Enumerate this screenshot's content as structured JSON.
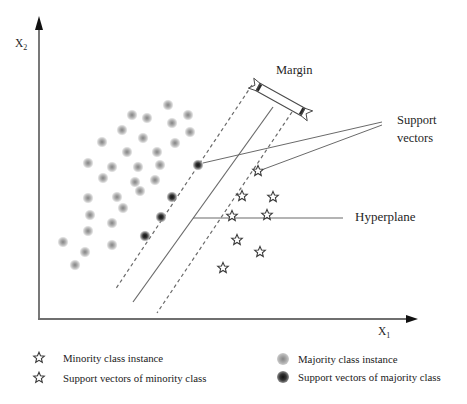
{
  "figure": {
    "axes": {
      "y_label_base": "X",
      "y_label_sub": "2",
      "x_label_base": "X",
      "x_label_sub": "1"
    },
    "labels": {
      "margin": "Margin",
      "support_vectors_line1": "Support",
      "support_vectors_line2": "vectors",
      "hyperplane": "Hyperplane"
    }
  },
  "legend": {
    "items": [
      {
        "icon": "open-star",
        "label": "Minority class instance"
      },
      {
        "icon": "open-star",
        "label": "Support vectors of minority class"
      },
      {
        "icon": "fuzzy-gray-dot",
        "label": "Majority class instance"
      },
      {
        "icon": "dark-dot",
        "label": "Support vectors of majority class"
      }
    ]
  },
  "chart_data": {
    "type": "scatter",
    "xlabel": "X1",
    "ylabel": "X2",
    "coordinate_space": "pixels, 467x404, y increases downward",
    "series": [
      {
        "name": "Majority class instance",
        "marker": "fuzzy-gray-dot",
        "points": [
          [
            168,
            105
          ],
          [
            188,
            115
          ],
          [
            132,
            115
          ],
          [
            147,
            118
          ],
          [
            172,
            123
          ],
          [
            122,
            130
          ],
          [
            190,
            132
          ],
          [
            143,
            138
          ],
          [
            102,
            142
          ],
          [
            175,
            143
          ],
          [
            127,
            152
          ],
          [
            157,
            152
          ],
          [
            88,
            163
          ],
          [
            160,
            165
          ],
          [
            112,
            167
          ],
          [
            138,
            167
          ],
          [
            103,
            178
          ],
          [
            155,
            180
          ],
          [
            135,
            182
          ],
          [
            140,
            191
          ],
          [
            117,
            197
          ],
          [
            88,
            198
          ],
          [
            123,
            208
          ],
          [
            90,
            215
          ],
          [
            112,
            223
          ],
          [
            88,
            231
          ],
          [
            63,
            242
          ],
          [
            112,
            245
          ],
          [
            85,
            252
          ],
          [
            75,
            265
          ]
        ]
      },
      {
        "name": "Support vectors of majority class",
        "marker": "dark-dot",
        "points": [
          [
            198,
            165
          ],
          [
            172,
            197
          ],
          [
            161,
            217
          ],
          [
            145,
            236
          ]
        ]
      },
      {
        "name": "Minority class instance",
        "marker": "open-star",
        "points": [
          [
            242,
            196
          ],
          [
            273,
            197
          ],
          [
            232,
            216
          ],
          [
            267,
            215
          ],
          [
            237,
            240
          ],
          [
            260,
            252
          ],
          [
            223,
            268
          ]
        ]
      },
      {
        "name": "Support vectors of minority class",
        "marker": "open-star",
        "points": [
          [
            258,
            171
          ]
        ]
      }
    ],
    "lines": {
      "hyperplane": {
        "x1": 273,
        "y1": 107,
        "x2": 133,
        "y2": 302,
        "style": "solid"
      },
      "margin_left": {
        "x1": 252,
        "y1": 85,
        "x2": 115,
        "y2": 290,
        "style": "dashed"
      },
      "margin_right": {
        "x1": 292,
        "y1": 112,
        "x2": 157,
        "y2": 313,
        "style": "dashed"
      }
    },
    "annotations": {
      "support_pointer_lines": [
        [
          382,
          122,
          203,
          163
        ],
        [
          382,
          125,
          264,
          169
        ]
      ],
      "hyperplane_pointer_line": [
        343,
        218,
        193,
        218
      ],
      "x_axis": {
        "x1": 38,
        "y1": 319,
        "x2": 408,
        "y2": 319,
        "arrow_tip_x": 418
      },
      "y_axis": {
        "x1": 39,
        "y1": 318,
        "x2": 39,
        "y2": 29,
        "arrow_tip_y": 16
      },
      "margin_ribbon": {
        "x1": 258,
        "y1": 87,
        "x2": 303,
        "y2": 112
      }
    },
    "colors": {
      "line_gray": "#6a6a6a",
      "axis_gray": "#3f3f3f",
      "majority_core": "#848484",
      "majority_mid": "#a9a9a9",
      "majority_edge": "#d0d0d0",
      "sv_core": "#111111",
      "sv_mid": "#333333",
      "sv_edge": "#8f8f8f",
      "star_stroke": "#3a3a3a",
      "text": "#1f1f1f"
    }
  }
}
